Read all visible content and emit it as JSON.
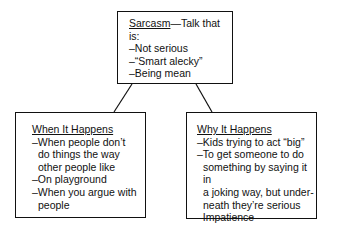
{
  "top_box": {
    "title": "Sarcasm",
    "title_suffix": "—Talk that is:",
    "items": [
      "–Not serious",
      "–“Smart alecky”",
      "–Being mean"
    ]
  },
  "left_box": {
    "title": "When It Happens",
    "items": [
      {
        "first": "–When people don’t",
        "rest": [
          "do things the way",
          "other people like"
        ]
      },
      {
        "first": "–On playground",
        "rest": []
      },
      {
        "first": "–When you argue with",
        "rest": [
          "people"
        ]
      }
    ]
  },
  "right_box": {
    "title": "Why It Happens",
    "items": [
      {
        "first": "–Kids trying to act “big”",
        "rest": []
      },
      {
        "first": "–To get someone to do",
        "rest": [
          "something by saying it in",
          "a joking way, but under-",
          "neath they’re serious"
        ]
      },
      {
        "first": "–Impatience",
        "rest": []
      }
    ]
  }
}
